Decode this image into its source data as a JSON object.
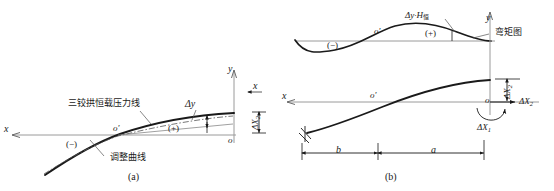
{
  "figure": {
    "type": "engineering-diagram",
    "stroke_color": "#1a1a1a",
    "axis_color": "#9a9a9a",
    "panels": [
      {
        "id": "a",
        "caption": "(a)",
        "axes": {
          "y_label": "y",
          "x_label_left": "x",
          "x_label_right": "x",
          "origin_label": "o"
        },
        "labels": {
          "pressure_line": "三铰拱恒载压力线",
          "adjust_curve": "调整曲线",
          "delta_y": "Δy",
          "hinge": "o'",
          "plus": "(+)",
          "minus": "(−)",
          "delta_x2": "ΔX",
          "delta_x2_sub": "2"
        }
      },
      {
        "id": "b",
        "caption": "(b)",
        "axes": {
          "y_label": "y",
          "x_label": "x",
          "origin_label": "o"
        },
        "labels": {
          "moment_product": "Δy·H",
          "moment_product_sub": "恒",
          "moment_diagram": "弯矩图",
          "hinge_top": "o'",
          "hinge_bottom": "o'",
          "plus": "(+)",
          "minus": "(−)",
          "delta_x1": "ΔX",
          "delta_x1_sub": "1",
          "delta_x2": "ΔX",
          "delta_x2_sub": "2",
          "delta_x2_vertical": "ΔX",
          "delta_x2_vertical_sub": "2",
          "dim_b": "b",
          "dim_a": "a"
        }
      }
    ]
  }
}
